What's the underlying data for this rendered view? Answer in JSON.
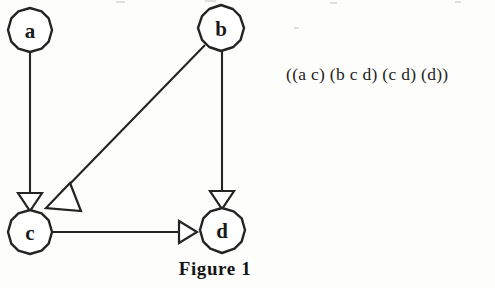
{
  "figure": {
    "caption": "Figure 1",
    "set_notation": "((a c) (b c d) (c d) (d))",
    "colors": {
      "ink": "#242424",
      "text": "#1a1a1a",
      "background": "#fdfdfc",
      "node_fill": "#ffffff"
    },
    "graph": {
      "type": "directed-graph",
      "node_radius": 22,
      "nodes": [
        {
          "id": "a",
          "label": "a",
          "cx": 30,
          "cy": 30
        },
        {
          "id": "b",
          "label": "b",
          "cx": 221,
          "cy": 28
        },
        {
          "id": "c",
          "label": "c",
          "cx": 30,
          "cy": 232
        },
        {
          "id": "d",
          "label": "d",
          "cx": 222,
          "cy": 230
        }
      ],
      "edges": [
        {
          "from": "a",
          "to": "c",
          "arrow": "open-triangle",
          "orientation": "vertical"
        },
        {
          "from": "b",
          "to": "c",
          "arrow": "open-triangle",
          "orientation": "diagonal"
        },
        {
          "from": "b",
          "to": "d",
          "arrow": "open-triangle",
          "orientation": "vertical"
        },
        {
          "from": "c",
          "to": "d",
          "arrow": "open-triangle",
          "orientation": "horizontal"
        }
      ],
      "adjacency_notation": [
        "(a c)",
        "(b c d)",
        "(c d)",
        "(d)"
      ]
    }
  }
}
